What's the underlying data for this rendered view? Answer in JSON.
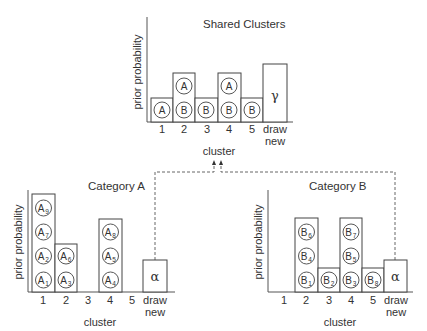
{
  "shared": {
    "title": "Shared Clusters",
    "ylabel": "prior probability",
    "xlabel": "cluster",
    "tick_labels": [
      "1",
      "2",
      "3",
      "4",
      "5",
      "draw",
      "new"
    ],
    "clusters": [
      {
        "label": "1",
        "tokens": [
          "A"
        ]
      },
      {
        "label": "2",
        "tokens": [
          "B",
          "A"
        ]
      },
      {
        "label": "3",
        "tokens": [
          "B"
        ]
      },
      {
        "label": "4",
        "tokens": [
          "B",
          "A"
        ]
      },
      {
        "label": "5",
        "tokens": [
          "B"
        ]
      }
    ],
    "new_symbol": "γ"
  },
  "category_a": {
    "title": "Category A",
    "ylabel": "prior probability",
    "xlabel": "cluster",
    "tick_labels": [
      "1",
      "2",
      "3",
      "4",
      "5",
      "draw",
      "new"
    ],
    "clusters": [
      {
        "label": "1",
        "tokens": [
          "A1",
          "A2",
          "A7",
          "A9"
        ]
      },
      {
        "label": "2",
        "tokens": [
          "A3",
          "A6"
        ]
      },
      {
        "label": "3",
        "tokens": []
      },
      {
        "label": "4",
        "tokens": [
          "A4",
          "A5",
          "A8"
        ]
      },
      {
        "label": "5",
        "tokens": []
      }
    ],
    "new_symbol": "α"
  },
  "category_b": {
    "title": "Category B",
    "ylabel": "prior probability",
    "xlabel": "cluster",
    "tick_labels": [
      "1",
      "2",
      "3",
      "4",
      "5",
      "draw",
      "new"
    ],
    "clusters": [
      {
        "label": "1",
        "tokens": []
      },
      {
        "label": "2",
        "tokens": [
          "B1",
          "B4",
          "B6"
        ]
      },
      {
        "label": "3",
        "tokens": [
          "B2"
        ]
      },
      {
        "label": "4",
        "tokens": [
          "B3",
          "B5",
          "B7"
        ]
      },
      {
        "label": "5",
        "tokens": [
          "B8"
        ]
      }
    ],
    "new_symbol": "α"
  },
  "tokens": {
    "A": "A",
    "B": "B",
    "A1": {
      "base": "A",
      "sub": "1"
    },
    "A2": {
      "base": "A",
      "sub": "2"
    },
    "A3": {
      "base": "A",
      "sub": "3"
    },
    "A4": {
      "base": "A",
      "sub": "4"
    },
    "A5": {
      "base": "A",
      "sub": "5"
    },
    "A6": {
      "base": "A",
      "sub": "6"
    },
    "A7": {
      "base": "A",
      "sub": "7"
    },
    "A8": {
      "base": "A",
      "sub": "8"
    },
    "A9": {
      "base": "A",
      "sub": "9"
    },
    "B1": {
      "base": "B",
      "sub": "1"
    },
    "B2": {
      "base": "B",
      "sub": "2"
    },
    "B3": {
      "base": "B",
      "sub": "3"
    },
    "B4": {
      "base": "B",
      "sub": "4"
    },
    "B5": {
      "base": "B",
      "sub": "5"
    },
    "B6": {
      "base": "B",
      "sub": "6"
    },
    "B7": {
      "base": "B",
      "sub": "7"
    },
    "B8": {
      "base": "B",
      "sub": "8"
    }
  },
  "connector": {
    "style": "dashed",
    "from": [
      "category_a.draw_new",
      "category_b.draw_new"
    ],
    "to": "shared.cluster_axis"
  }
}
